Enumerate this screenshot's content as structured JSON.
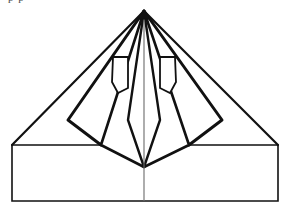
{
  "figure": {
    "partial_caption_text": "p  p",
    "canvas": {
      "width": 287,
      "height": 209
    },
    "colors": {
      "stroke": "#111111",
      "thin_stroke": "#6b6b6b",
      "background": "#ffffff"
    },
    "stroke_widths": {
      "heavy": 3.0,
      "medium": 2.0,
      "light": 1.3,
      "hairline": 1.0
    },
    "points": {
      "apex": [
        144,
        11
      ],
      "base_left": [
        12,
        145
      ],
      "base_right": [
        278,
        145
      ],
      "bottom_left": [
        12,
        201
      ],
      "bottom_right": [
        278,
        201
      ],
      "center_bottom": [
        144,
        201
      ],
      "converge": [
        144,
        167
      ],
      "left_diamond_point": [
        68,
        120
      ],
      "right_diamond_point": [
        222,
        120
      ],
      "left_shoulder": [
        101,
        145
      ],
      "right_shoulder": [
        189,
        145
      ],
      "left_flap_top": [
        116,
        57
      ],
      "right_flap_top": [
        174,
        57
      ]
    },
    "shapes": [
      {
        "name": "base-rectangle",
        "kind": "rect"
      },
      {
        "name": "outer-triangle-left-edge",
        "kind": "line"
      },
      {
        "name": "outer-triangle-right-edge",
        "kind": "line"
      },
      {
        "name": "center-vertical-crease",
        "kind": "line"
      },
      {
        "name": "left-inner-diamond",
        "kind": "polygon"
      },
      {
        "name": "right-inner-diamond",
        "kind": "polygon"
      },
      {
        "name": "left-inner-petal",
        "kind": "polygon"
      },
      {
        "name": "right-inner-petal",
        "kind": "polygon"
      },
      {
        "name": "left-flap-tab",
        "kind": "polygon"
      },
      {
        "name": "right-flap-tab",
        "kind": "polygon"
      },
      {
        "name": "left-converge-fold",
        "kind": "line"
      },
      {
        "name": "right-converge-fold",
        "kind": "line"
      }
    ]
  }
}
